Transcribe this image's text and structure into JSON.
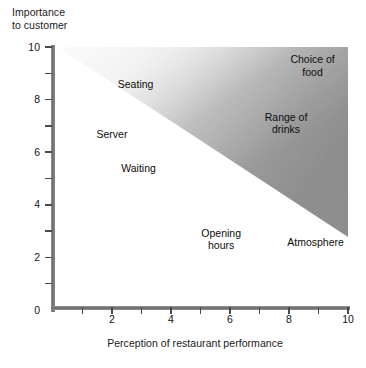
{
  "chart_data": {
    "type": "scatter",
    "title": "",
    "xlabel": "Perception of restaurant performance",
    "ylabel": "Importance\nto customer",
    "ylabel_line1": "Importance",
    "ylabel_line2": "to customer",
    "xlim": [
      0,
      10
    ],
    "ylim": [
      0,
      10
    ],
    "grid": false,
    "legend": "none",
    "xticks": [
      0,
      1,
      2,
      3,
      4,
      5,
      6,
      7,
      8,
      9,
      10
    ],
    "yticks": [
      0,
      1,
      2,
      3,
      4,
      5,
      6,
      7,
      8,
      9,
      10
    ],
    "xtick_labels": [
      "",
      "",
      "2",
      "",
      "4",
      "",
      "6",
      "",
      "8",
      "",
      "10"
    ],
    "ytick_labels": [
      "0",
      "",
      "2",
      "",
      "4",
      "",
      "6",
      "",
      "8",
      "",
      "10"
    ],
    "points": [
      {
        "label": "Seating",
        "lines": [
          "Seating"
        ],
        "x": 2.8,
        "y": 8.6
      },
      {
        "label": "Server",
        "lines": [
          "Server"
        ],
        "x": 2.0,
        "y": 6.7
      },
      {
        "label": "Waiting",
        "lines": [
          "Waiting"
        ],
        "x": 2.9,
        "y": 5.4
      },
      {
        "label": "Opening hours",
        "lines": [
          "Opening",
          "hours"
        ],
        "x": 5.7,
        "y": 2.7
      },
      {
        "label": "Atmosphere",
        "lines": [
          "Atmosphere"
        ],
        "x": 8.9,
        "y": 2.6
      },
      {
        "label": "Range of drinks",
        "lines": [
          "Range of",
          "drinks"
        ],
        "x": 7.9,
        "y": 7.1
      },
      {
        "label": "Choice of food",
        "lines": [
          "Choice of",
          "food"
        ],
        "x": 8.8,
        "y": 9.3
      }
    ],
    "shaded_region": {
      "name": "improvement-zone",
      "description": "Diagonal shaded wedge in the upper-right of the plot, darkening toward the right edge",
      "color_light": "#f2f2f2",
      "color_dark": "#8d8d8d"
    },
    "axis_color": "#7d7d7d",
    "text_color": "#111111"
  },
  "labels": {
    "y_title_line1": "Importance",
    "y_title_line2": "to customer",
    "x_title": "Perception of restaurant performance"
  }
}
